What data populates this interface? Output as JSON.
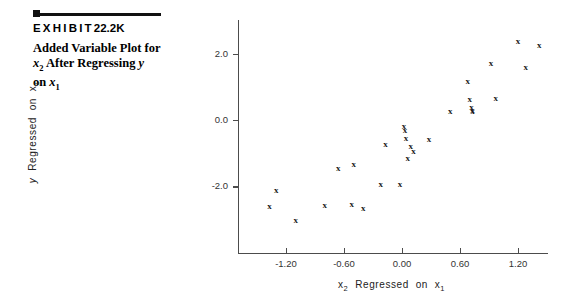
{
  "exhibit": {
    "label_word": "EXHIBIT",
    "number": "22.2K",
    "caption_line1": "Added Variable Plot for",
    "caption_line2_a": "x",
    "caption_line2_sub": "2",
    "caption_line2_b": " After Regressing ",
    "caption_line2_c": "y",
    "caption_line3_a": "on ",
    "caption_line3_b": "x",
    "caption_line3_sub": "1"
  },
  "chart_data": {
    "type": "scatter",
    "title": "Added Variable Plot for x2 After Regressing y on x1",
    "xlabel": "x2 Regressed on x1",
    "ylabel": "y Regressed on x1",
    "xlabel_parts": {
      "var": "x",
      "sub": "2",
      "mid": "Regressed  on",
      "var2": "x",
      "sub2": "1"
    },
    "ylabel_parts": {
      "var": "y",
      "mid": "Regressed  on",
      "var2": "x",
      "sub2": "1"
    },
    "xlim": [
      -1.7,
      1.51
    ],
    "ylim": [
      -3.35,
      2.82
    ],
    "xticks": [
      -1.2,
      -0.6,
      0.0,
      0.6,
      1.2
    ],
    "xtick_labels": [
      "-1.20",
      "-0.60",
      "0.00",
      "0.60",
      "1.20"
    ],
    "yticks": [
      2.0,
      0.0,
      -2.0
    ],
    "ytick_labels": [
      "2.0",
      "0.0",
      "-2.0"
    ],
    "grid": false,
    "legend": null,
    "marker": "x",
    "marker_color": "#1a1a1a",
    "axis_color": "#4c4c4c",
    "n_points": 29,
    "points": [
      {
        "x": -1.3,
        "y": -2.1
      },
      {
        "x": -1.37,
        "y": -2.58
      },
      {
        "x": -1.1,
        "y": -3.0
      },
      {
        "x": -0.8,
        "y": -2.56
      },
      {
        "x": -0.66,
        "y": -1.45
      },
      {
        "x": -0.5,
        "y": -1.33
      },
      {
        "x": -0.52,
        "y": -2.54
      },
      {
        "x": -0.4,
        "y": -2.65
      },
      {
        "x": -0.22,
        "y": -1.93
      },
      {
        "x": -0.17,
        "y": -0.72
      },
      {
        "x": -0.02,
        "y": -1.94
      },
      {
        "x": 0.02,
        "y": -0.17
      },
      {
        "x": 0.03,
        "y": -0.3
      },
      {
        "x": 0.04,
        "y": -0.55
      },
      {
        "x": 0.06,
        "y": -1.14
      },
      {
        "x": 0.09,
        "y": -0.78
      },
      {
        "x": 0.12,
        "y": -0.92
      },
      {
        "x": 0.28,
        "y": -0.58
      },
      {
        "x": 0.5,
        "y": 0.27
      },
      {
        "x": 0.68,
        "y": 1.17
      },
      {
        "x": 0.7,
        "y": 0.62
      },
      {
        "x": 0.72,
        "y": 0.38
      },
      {
        "x": 0.73,
        "y": 0.3
      },
      {
        "x": 0.73,
        "y": 0.26
      },
      {
        "x": 0.92,
        "y": 1.72
      },
      {
        "x": 0.97,
        "y": 0.65
      },
      {
        "x": 1.2,
        "y": 2.38
      },
      {
        "x": 1.28,
        "y": 1.6
      },
      {
        "x": 1.42,
        "y": 2.25
      }
    ]
  }
}
